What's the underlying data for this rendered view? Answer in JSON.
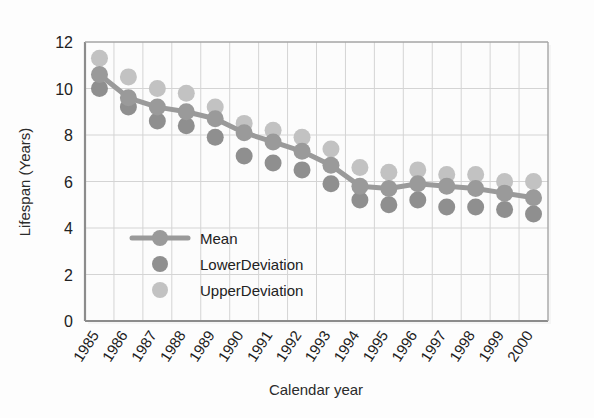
{
  "chart_data": {
    "type": "line",
    "title": "",
    "xlabel": "Calendar year",
    "ylabel": "Lifespan (Years)",
    "categories": [
      "1985",
      "1986",
      "1987",
      "1988",
      "1989",
      "1990",
      "1991",
      "1992",
      "1993",
      "1994",
      "1995",
      "1996",
      "1997",
      "1998",
      "1999",
      "2000"
    ],
    "ylim": [
      0,
      12
    ],
    "yticks": [
      0,
      2,
      4,
      6,
      8,
      10,
      12
    ],
    "grid": true,
    "legend_position": "inside-lower-left",
    "series": [
      {
        "name": "Mean",
        "marker": "circle",
        "line": true,
        "color": "#9a9a9a",
        "values": [
          10.6,
          9.6,
          9.2,
          9.0,
          8.7,
          8.1,
          7.7,
          7.3,
          6.7,
          5.8,
          5.7,
          5.9,
          5.8,
          5.7,
          5.5,
          5.3
        ]
      },
      {
        "name": "LowerDeviation",
        "marker": "circle",
        "line": false,
        "color": "#8f8f8f",
        "values": [
          10.0,
          9.2,
          8.6,
          8.4,
          7.9,
          7.1,
          6.8,
          6.5,
          5.9,
          5.2,
          5.0,
          5.2,
          4.9,
          4.9,
          4.8,
          4.6
        ]
      },
      {
        "name": "UpperDeviation",
        "marker": "circle",
        "line": false,
        "color": "#c2c2c2",
        "values": [
          11.3,
          10.5,
          10.0,
          9.8,
          9.2,
          8.5,
          8.2,
          7.9,
          7.4,
          6.6,
          6.4,
          6.5,
          6.3,
          6.3,
          6.0,
          6.0
        ]
      }
    ]
  },
  "axes": {
    "y_axis_title": "Lifespan (Years)",
    "x_axis_title": "Calendar year",
    "y_tick_labels": [
      "0",
      "2",
      "4",
      "6",
      "8",
      "10",
      "12"
    ],
    "x_tick_labels": [
      "1985",
      "1986",
      "1987",
      "1988",
      "1989",
      "1990",
      "1991",
      "1992",
      "1993",
      "1994",
      "1995",
      "1996",
      "1997",
      "1998",
      "1999",
      "2000"
    ]
  },
  "legend": {
    "items": [
      {
        "label": "Mean",
        "style": "line-marker",
        "color": "#9a9a9a"
      },
      {
        "label": "LowerDeviation",
        "style": "marker",
        "color": "#8f8f8f"
      },
      {
        "label": "UpperDeviation",
        "style": "marker",
        "color": "#c2c2c2"
      }
    ]
  },
  "colors": {
    "mean": "#9a9a9a",
    "lower": "#8f8f8f",
    "upper": "#c2c2c2",
    "grid": "#d4d4d4",
    "axis": "#8c8c8c",
    "plot_background": "#fcfcfc",
    "page_background": "#fdfdfd"
  }
}
